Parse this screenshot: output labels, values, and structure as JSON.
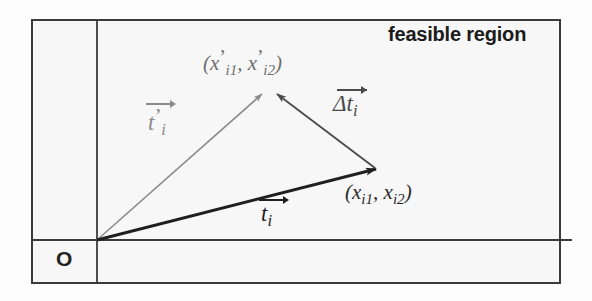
{
  "figure": {
    "background_color": "#fdfdfd",
    "frame": {
      "name": "outer-rectangle",
      "x": 32,
      "y": 20,
      "width": 528,
      "height": 263,
      "stroke": "#3a3a3a",
      "stroke_width": 2
    },
    "axes": {
      "vertical_axis": {
        "x": 97,
        "y_top": 20,
        "y_bottom": 283,
        "stroke": "#3a3a3a"
      },
      "horizontal_axis": {
        "y": 240,
        "x_left": 32,
        "x_right": 572,
        "stroke": "#3a3a3a"
      }
    },
    "labels": {
      "feasible_region": "feasible region",
      "origin": "O",
      "coord_prime": {
        "open": "(",
        "x1_base": "x",
        "x1_prime": "’",
        "x1_sub": "i1",
        "comma": ", ",
        "x2_base": "x",
        "x2_prime": "’",
        "x2_sub": "i2",
        "close": ")"
      },
      "coord": {
        "open": "(",
        "x1_base": "x",
        "x1_sub": "i1",
        "comma": ", ",
        "x2_base": "x",
        "x2_sub": "i2",
        "close": ")"
      }
    },
    "vectors": [
      {
        "name": "t-prime-i",
        "base": "t",
        "prime": "’",
        "subscript": "i",
        "color": "#8a8a8a",
        "stroke_width": 1.6,
        "from": {
          "x": 97,
          "y": 240
        },
        "to": {
          "x": 264,
          "y": 92
        },
        "description": "vector from origin to primed point"
      },
      {
        "name": "delta-t-i",
        "base": "Δt",
        "prime": "",
        "subscript": "i",
        "color": "#4a4a4a",
        "stroke_width": 1.8,
        "from": {
          "x": 375,
          "y": 168
        },
        "to": {
          "x": 276,
          "y": 92
        },
        "description": "displacement vector from unprimed point to primed point"
      },
      {
        "name": "t-i",
        "base": "t",
        "prime": "",
        "subscript": "i",
        "color": "#1f1f1f",
        "stroke_width": 3.0,
        "from": {
          "x": 97,
          "y": 240
        },
        "to": {
          "x": 379,
          "y": 170
        },
        "description": "vector from origin to unprimed point"
      }
    ]
  }
}
